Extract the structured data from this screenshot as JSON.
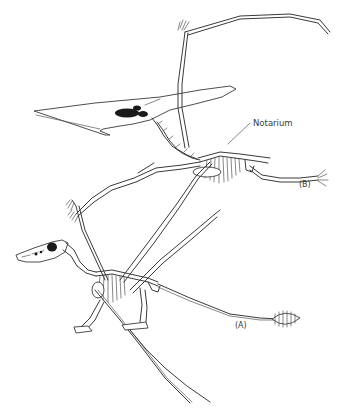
{
  "figure": {
    "labels": {
      "notarium": "Notarium",
      "specimen_b": "(B)",
      "specimen_a": "(A)"
    },
    "specimens": [
      {
        "id": "A",
        "type": "long-tailed pterosaur (rhamphorhynchoid) skeleton with tail vane"
      },
      {
        "id": "B",
        "type": "crested short-tailed pterosaur (pterodactyloid) skeleton"
      }
    ],
    "colors": {
      "line": "#3a3a3a",
      "background": "#ffffff",
      "fenestra": "#1a1a1a"
    }
  }
}
